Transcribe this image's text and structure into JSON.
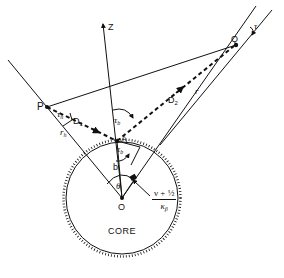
{
  "diagram": {
    "type": "geometry-schematic",
    "colors": {
      "ink": "#111111",
      "background": "#ffffff"
    },
    "points": {
      "P": {
        "label": "P"
      },
      "Q": {
        "label": "Q"
      },
      "A": {
        "label": "A"
      },
      "O": {
        "label": "O"
      }
    },
    "axes": {
      "z": {
        "label": "Z"
      }
    },
    "segments": {
      "d1": {
        "label": "D",
        "sub": "1",
        "style": "dashed-arrow"
      },
      "d2": {
        "label": "D",
        "sub": "2",
        "style": "dashed-arrow"
      },
      "r": {
        "label": "r"
      },
      "b": {
        "label": "b"
      },
      "rh": {
        "label": "r",
        "sub": "h"
      }
    },
    "angles": {
      "tau_h": {
        "label": "τ",
        "sub": "h"
      },
      "tau_b_upper": {
        "label": "τ",
        "sub": "b"
      },
      "tau_b_lower": {
        "label": "τ",
        "sub": "b"
      },
      "tau": {
        "label": "τ"
      },
      "theta": {
        "label": "θ"
      }
    },
    "fraction": {
      "numerator": "ν + ½",
      "denominator": "κ",
      "den_sub": "β"
    },
    "core": {
      "label": "CORE"
    }
  }
}
